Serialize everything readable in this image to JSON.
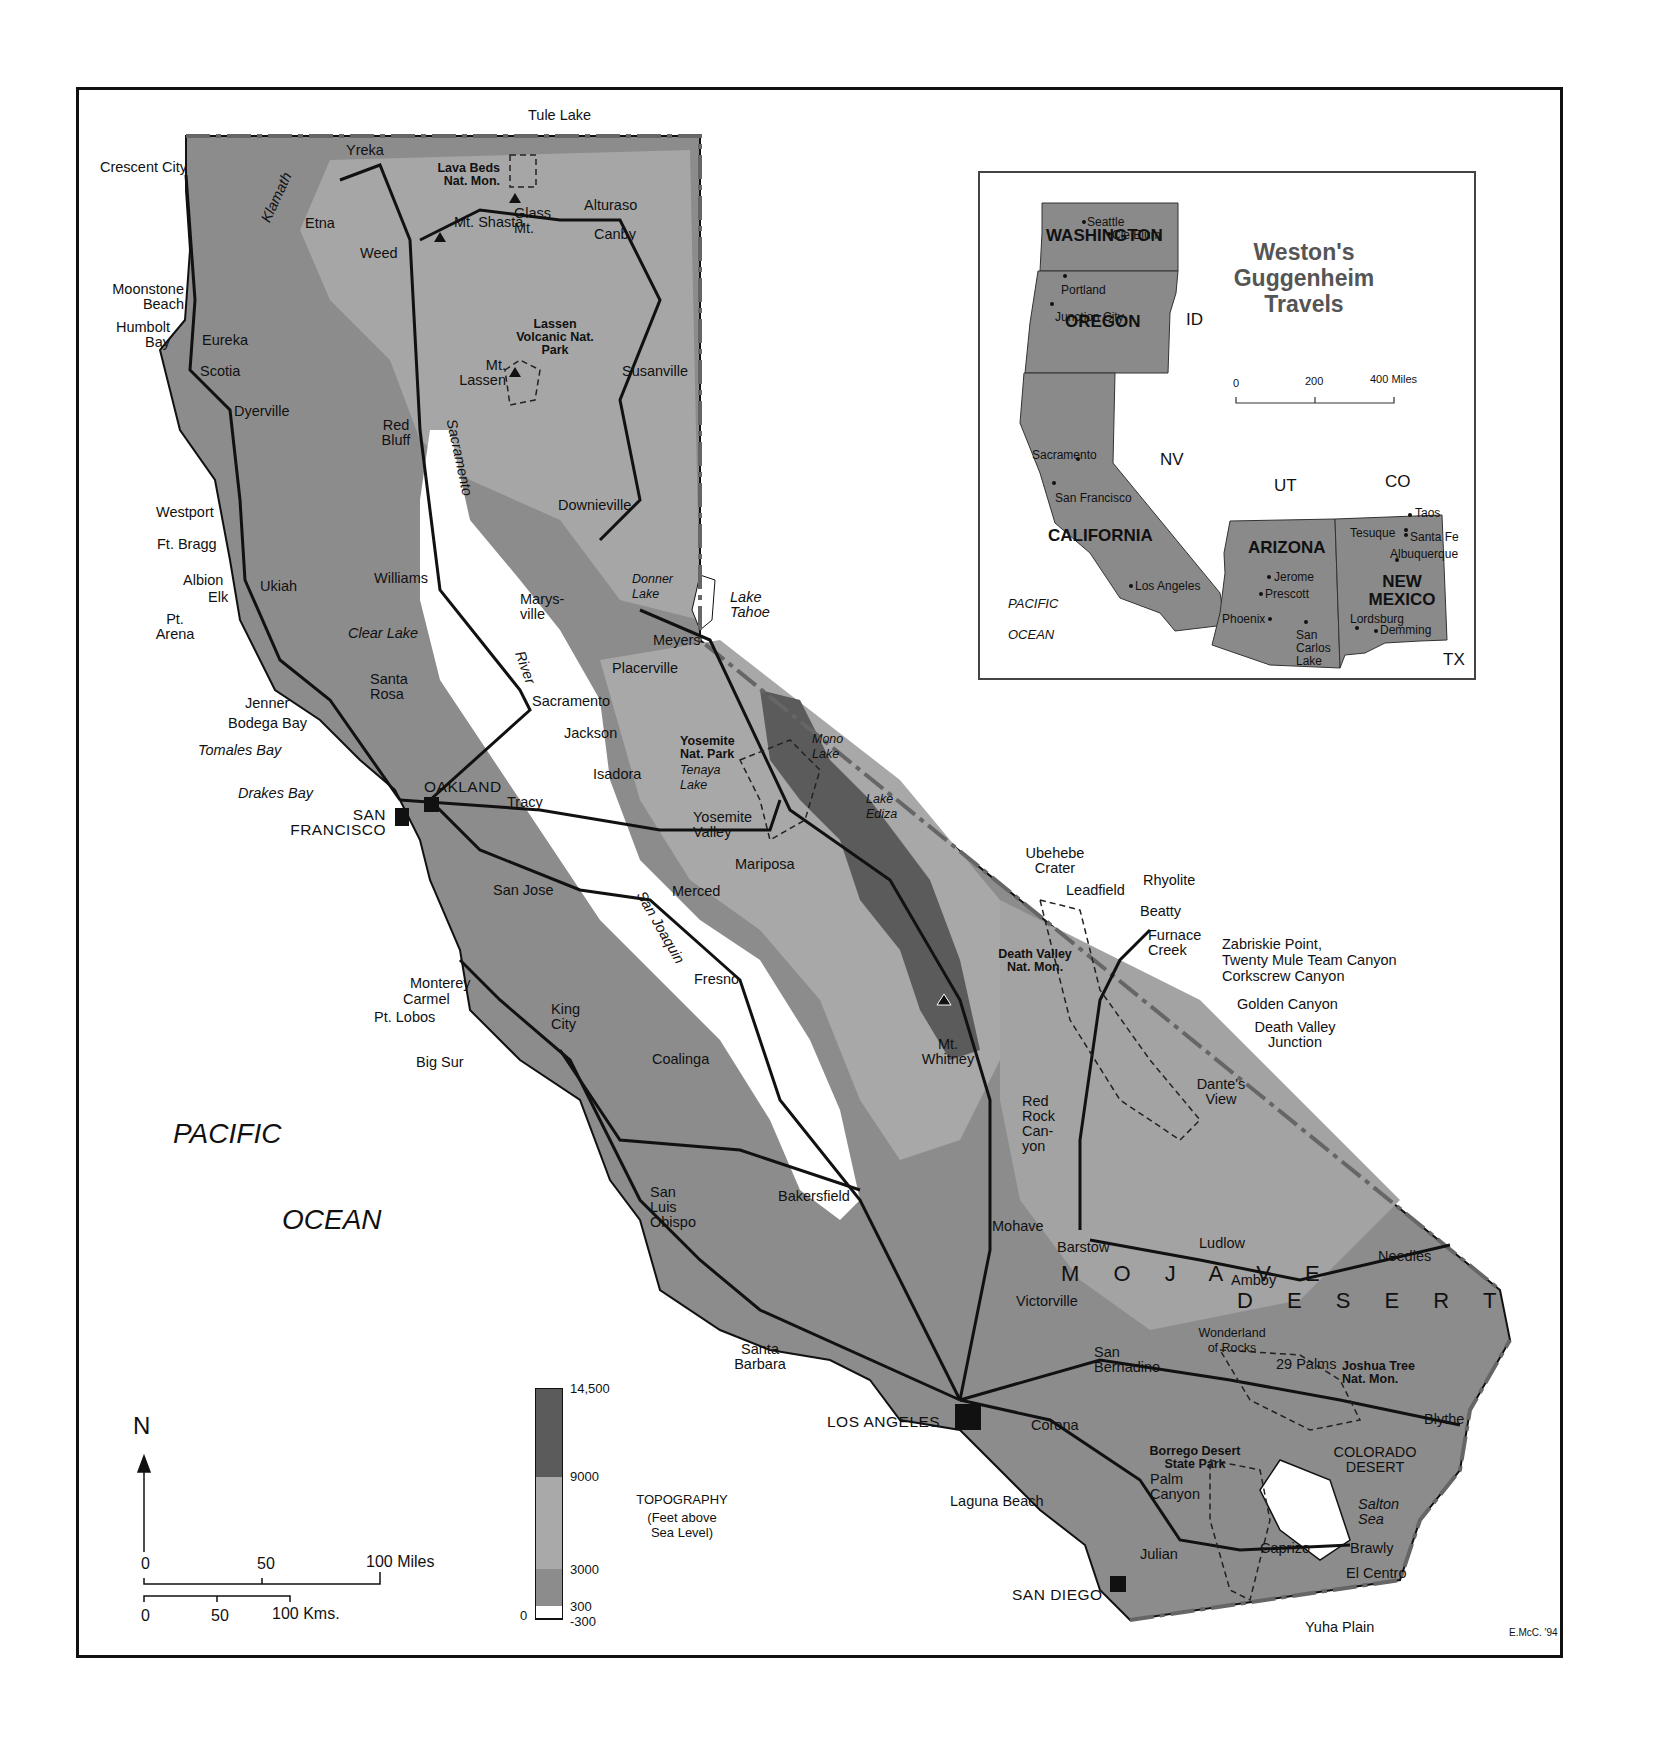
{
  "map": {
    "title": "Weston's Guggenheim Travels",
    "credit": "E.McC. '94",
    "colors": {
      "land_low": "#8a8a8a",
      "land_mid": "#a9a9a9",
      "land_high": "#5b5b5b",
      "valley": "#ffffff",
      "roads": "#111111",
      "border": "#666666"
    },
    "ocean": {
      "line1": "PACIFIC",
      "line2": "OCEAN"
    },
    "regions": {
      "mojave": "M O J A V E",
      "desert": "D E S E R T",
      "colorado_desert": "COLORADO DESERT"
    },
    "parks": [
      "Lava Beds Nat. Mon.",
      "Lassen Volcanic Nat. Park",
      "Yosemite Nat. Park",
      "Death Valley Nat. Mon.",
      "Joshua Tree Nat. Mon.",
      "Borrego Desert State Park"
    ],
    "major_cities": [
      "SAN FRANCISCO",
      "OAKLAND",
      "LOS ANGELES",
      "SAN DIEGO"
    ],
    "places": {
      "tule_lake": "Tule Lake",
      "crescent_city": "Crescent City",
      "yreka": "Yreka",
      "klamath": "Klamath",
      "klamath_r": "R.",
      "etna": "Etna",
      "weed": "Weed",
      "mt_shasta": "Mt. Shasta",
      "glass_mt": "Glass Mt.",
      "alturaso": "Alturaso",
      "canby": "Canby",
      "moonstone_beach": "Moonstone Beach",
      "humbolt_bay": "Humbolt Bay",
      "eureka": "Eureka",
      "scotia": "Scotia",
      "mt_lassen": "Mt. Lassen",
      "susanville": "Susanville",
      "dyerville": "Dyerville",
      "red_bluff": "Red Bluff",
      "sacramento_river": "Sacramento",
      "westport": "Westport",
      "downieville": "Downieville",
      "ft_bragg": "Ft. Bragg",
      "albion": "Albion",
      "elk": "Elk",
      "ukiah": "Ukiah",
      "williams": "Williams",
      "marysville": "Marys-ville",
      "donner_lake": "Donner Lake",
      "lake_tahoe": "Lake Tahoe",
      "pt_arena": "Pt. Arena",
      "clear_lake": "Clear Lake",
      "meyers": "Meyers",
      "placerville": "Placerville",
      "river": "River",
      "santa_rosa": "Santa Rosa",
      "sacramento": "Sacramento",
      "jenner": "Jenner",
      "bodega_bay": "Bodega Bay",
      "jackson": "Jackson",
      "tomales_bay": "Tomales Bay",
      "mono_lake": "Mono Lake",
      "tenaya_lake": "Tenaya Lake",
      "isadora": "Isadora",
      "drakes_bay": "Drakes Bay",
      "tracy": "Tracy",
      "lake_ediza": "Lake Ediza",
      "yosemite_valley": "Yosemite Valley",
      "mariposa": "Mariposa",
      "ubehebe_crater": "Ubehebe Crater",
      "rhyolite": "Rhyolite",
      "leadfield": "Leadfield",
      "san_jose": "San Jose",
      "merced": "Merced",
      "beatty": "Beatty",
      "furnace_creek": "Furnace Creek",
      "zabriskie": "Zabriskie Point,",
      "twenty_mule": "Twenty Mule Team Canyon",
      "corkscrew": "Corkscrew Canyon",
      "san_joaquin": "San Joaquin",
      "fresno": "Fresno",
      "monterey": "Monterey",
      "carmel": "Carmel",
      "pt_lobos": "Pt. Lobos",
      "golden_canyon": "Golden Canyon",
      "death_valley_junction": "Death Valley Junction",
      "king_city": "King City",
      "mt_whitney": "Mt. Whitney",
      "big_sur": "Big Sur",
      "coalinga": "Coalinga",
      "dantes_view": "Dante's View",
      "red_rock_canyon": "Red Rock Can-yon",
      "san_luis_obispo": "San Luis Obispo",
      "bakersfield": "Bakersfield",
      "mohave": "Mohave",
      "barstow": "Barstow",
      "ludlow": "Ludlow",
      "needles": "Needles",
      "amboy": "Amboy",
      "victorville": "Victorville",
      "wonderland": "Wonderland of Rocks",
      "san_bernadino": "San Bernadino",
      "twentynine_palms": "29 Palms",
      "santa_barbara": "Santa Barbara",
      "corona": "Corona",
      "blythe": "Blythe",
      "laguna_beach": "Laguna Beach",
      "palm_canyon": "Palm Canyon",
      "salton_sea": "Salton Sea",
      "julian": "Julian",
      "caprizo": "Caprizo",
      "brawly": "Brawly",
      "el_centro": "El Centro",
      "yuha_plain": "Yuha Plain"
    },
    "scale": {
      "miles": [
        "0",
        "50",
        "100 Miles"
      ],
      "kms": [
        "0",
        "50",
        "100 Kms."
      ],
      "north": "N"
    },
    "legend": {
      "title": "TOPOGRAPHY",
      "subtitle": "(Feet above Sea Level)",
      "ticks": [
        "14,500",
        "9000",
        "3000",
        "300",
        "-300"
      ],
      "zero": "0"
    }
  },
  "inset": {
    "title": "Weston's Guggenheim Travels",
    "states": {
      "washington": "WASHINGTON",
      "oregon": "OREGON",
      "california": "CALIFORNIA",
      "arizona": "ARIZONA",
      "new_mexico": "NEW MEXICO",
      "id": "ID",
      "nv": "NV",
      "ut": "UT",
      "co": "CO",
      "tx": "TX"
    },
    "cities": {
      "seattle": "Seattle",
      "cle_elum": "Cle Elum",
      "portland": "Portland",
      "junction_city": "Junction City",
      "sacramento": "Sacramento",
      "san_francisco": "San Francisco",
      "los_angeles": "Los Angeles",
      "jerome": "Jerome",
      "prescott": "Prescott",
      "phoenix": "Phoenix",
      "san_carlos_lake": "San Carlos Lake",
      "taos": "Taos",
      "tesuque": "Tesuque",
      "santa_fe": "Santa Fe",
      "albuquerque": "Albuquerque",
      "lordsburg": "Lordsburg",
      "demming": "Demming"
    },
    "ocean": {
      "line1": "PACIFIC",
      "line2": "OCEAN"
    },
    "scale": [
      "0",
      "200",
      "400 Miles"
    ]
  }
}
